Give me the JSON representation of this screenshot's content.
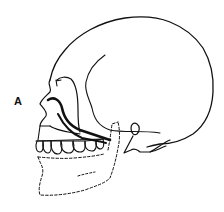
{
  "figure": {
    "label": "A",
    "colors": {
      "line": "#111111",
      "background": "#ffffff"
    }
  }
}
